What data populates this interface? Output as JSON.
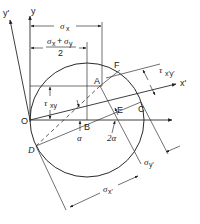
{
  "diagram": {
    "type": "Mohr's circle for plane stress",
    "points": {
      "O": "O",
      "A": "A",
      "B": "B",
      "C": "C",
      "D": "D",
      "E": "E",
      "F": "F"
    },
    "axes": {
      "y": "y",
      "y_prime": "y'",
      "x_prime": "x'"
    },
    "dimensions": {
      "sigma_x": "σ",
      "sigma_x_sub": "x",
      "mean_stress_num_a": "σ",
      "mean_stress_num_a_sub": "x",
      "mean_stress_plus": "+",
      "mean_stress_num_b": "σ",
      "mean_stress_num_b_sub": "y",
      "mean_stress_den": "2",
      "tau_xy": "τ",
      "tau_xy_sub": "xy",
      "tau_xpyp": "τ",
      "tau_xpyp_sub": "x'y'",
      "sigma_xp": "σ",
      "sigma_xp_sub": "x'",
      "sigma_yp": "σ",
      "sigma_yp_sub": "y'"
    },
    "angles": {
      "alpha": "α",
      "two_alpha": "2α"
    }
  }
}
